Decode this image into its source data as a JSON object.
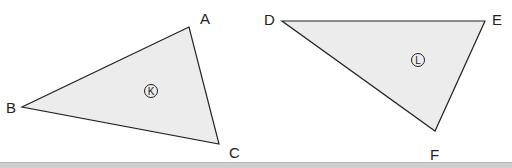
{
  "colors": {
    "fill": "#ececec",
    "stroke": "#222222"
  },
  "triangles": [
    {
      "id": "K",
      "label": "K",
      "vertices": [
        {
          "name": "A",
          "x": 189,
          "y": 27,
          "lx": 200,
          "ly": 24
        },
        {
          "name": "B",
          "x": 22,
          "y": 107,
          "lx": 6,
          "ly": 113
        },
        {
          "name": "C",
          "x": 219,
          "y": 144,
          "lx": 229,
          "ly": 158
        }
      ],
      "marker": {
        "x": 151,
        "y": 91
      }
    },
    {
      "id": "L",
      "label": "L",
      "vertices": [
        {
          "name": "D",
          "x": 282,
          "y": 21,
          "lx": 264,
          "ly": 25
        },
        {
          "name": "E",
          "x": 485,
          "y": 21,
          "lx": 492,
          "ly": 25
        },
        {
          "name": "F",
          "x": 435,
          "y": 131,
          "lx": 430,
          "ly": 160
        }
      ],
      "marker": {
        "x": 418,
        "y": 60
      }
    }
  ]
}
